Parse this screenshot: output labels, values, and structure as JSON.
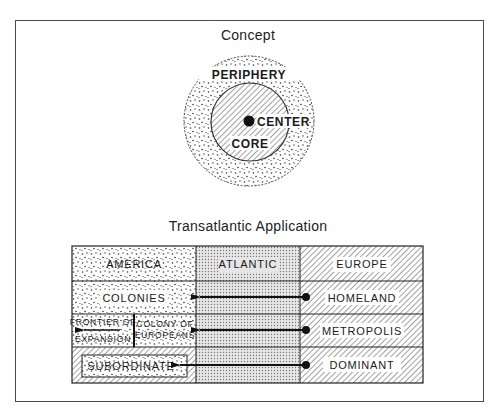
{
  "concept": {
    "title": "Concept",
    "labels": {
      "periphery": "PERIPHERY",
      "core": "CORE",
      "center": "CENTER"
    }
  },
  "application": {
    "title": "Transatlantic Application",
    "columns": [
      {
        "key": "america",
        "label": "AMERICA"
      },
      {
        "key": "atlantic",
        "label": "ATLANTIC"
      },
      {
        "key": "europe",
        "label": "EUROPE"
      }
    ],
    "rows": [
      {
        "america": "COLONIES",
        "europe": "HOMELAND"
      },
      {
        "america_left_line1": "FRONTIER OF",
        "america_left_line2": "EXPANSION",
        "america_right_line1": "COLONY OF",
        "america_right_line2": "EUROPEANS",
        "europe": "METROPOLIS"
      },
      {
        "america": "SUBORDINATE",
        "europe": "DOMINANT"
      }
    ]
  },
  "colors": {
    "ink": "#1a1a1a",
    "frame": "#4a4a4a",
    "background": "#ffffff"
  }
}
